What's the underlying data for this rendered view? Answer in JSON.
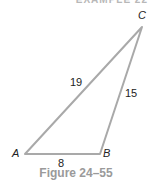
{
  "header": {
    "text": "EXAMPLE 22"
  },
  "figure": {
    "vertices": {
      "A": {
        "label": "A",
        "x": 25,
        "y": 154
      },
      "B": {
        "label": "B",
        "x": 100,
        "y": 154
      },
      "C": {
        "label": "C",
        "x": 142,
        "y": 27
      }
    },
    "sides": {
      "AB": "8",
      "BC": "15",
      "AC": "19"
    },
    "line_color": "#a9a9a9",
    "caption": "Figure 24–55"
  }
}
